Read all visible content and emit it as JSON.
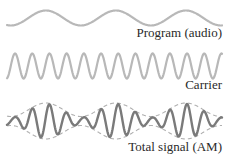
{
  "diagram": {
    "panels": [
      {
        "id": "program",
        "label": "Program (audio)",
        "color": "#b8b8b8",
        "stroke_width": 2.2,
        "center_y": 18,
        "amplitude": 7.5,
        "period_px": 70,
        "phase_start": "trough"
      },
      {
        "id": "carrier",
        "label": "Carrier",
        "color": "#b8b8b8",
        "stroke_width": 2.2,
        "center_y": 66,
        "amplitude": 12.5,
        "period_px": 17.2
      },
      {
        "id": "am",
        "label": "Total signal (AM)",
        "color": "#7a7a7a",
        "envelope_color": "#b0b0b0",
        "stroke_width": 2.4,
        "center_y": 121,
        "max_amplitude": 17,
        "min_amplitude": 3.5,
        "envelope_style": "dashed"
      }
    ],
    "x_start": 7,
    "x_end": 222
  }
}
